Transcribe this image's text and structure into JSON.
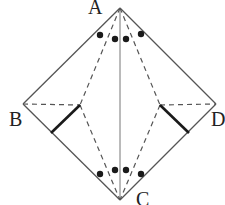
{
  "figure": {
    "vertices": {
      "A": "A",
      "B": "B",
      "C": "C",
      "D": "D"
    },
    "angle_marks_at_A": 4,
    "angle_marks_at_C": 4
  }
}
